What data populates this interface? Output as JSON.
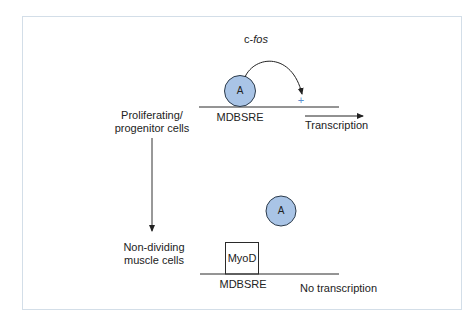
{
  "diagram": {
    "gene_label_prefix": "c-",
    "gene_label_italic": "fos",
    "states": {
      "top": {
        "cell_label_line1": "Proliferating/",
        "cell_label_line2": "progenitor cells",
        "factor_label": "A",
        "element_label": "MDBSRE",
        "activation_symbol": "+",
        "outcome_label": "Transcription"
      },
      "bottom": {
        "cell_label_line1": "Non-dividing",
        "cell_label_line2": "muscle cells",
        "factor_label": "A",
        "blocker_label": "MyoD",
        "element_label": "MDBSRE",
        "outcome_label": "No transcription"
      }
    },
    "colors": {
      "factor_fill": "#a9c4e6",
      "factor_stroke": "#2b3a4a",
      "plus": "#5b8fd0",
      "frame": "#d3dee8",
      "line": "#2a2a2a"
    }
  }
}
